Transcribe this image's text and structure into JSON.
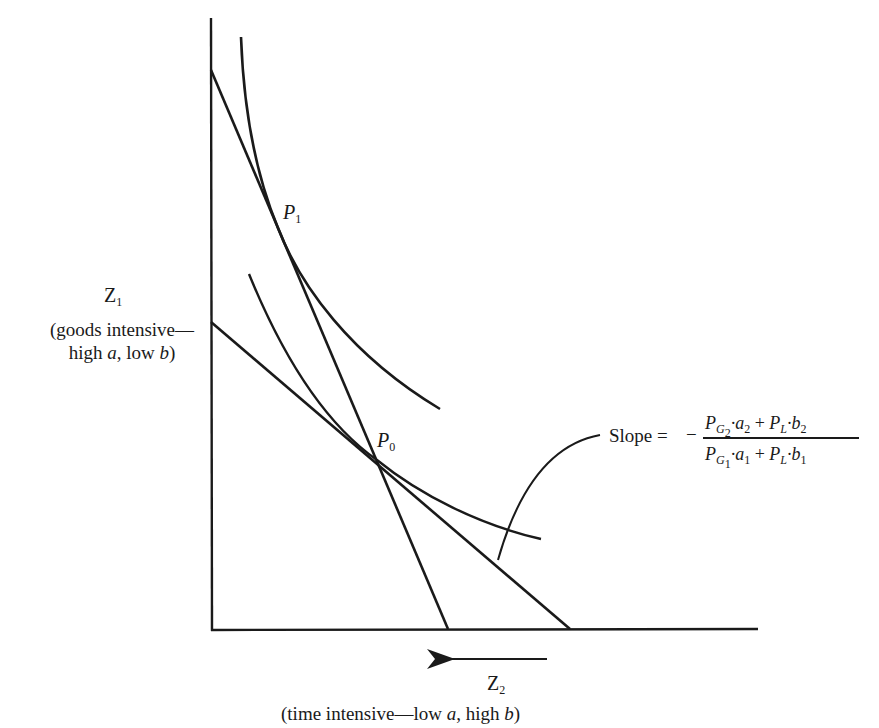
{
  "diagram": {
    "type": "indifference-curve budget-line diagram",
    "axes": {
      "y": {
        "label": "Z",
        "label_sub": "1",
        "description_line1": "(goods intensive—",
        "description_line2_a": "high ",
        "description_line2_b": "a",
        "description_line2_c": ", low ",
        "description_line2_d": "b",
        "description_line2_e": ")"
      },
      "x": {
        "label": "Z",
        "label_sub": "2",
        "description_a": "(time intensive—low ",
        "description_b": "a",
        "description_c": ", high ",
        "description_d": "b",
        "description_e": ")",
        "arrow_direction": "left"
      }
    },
    "points": [
      {
        "id": "P1",
        "label": "P",
        "sub": "1"
      },
      {
        "id": "P0",
        "label": "P",
        "sub": "0"
      }
    ],
    "annotation": {
      "prefix": "Slope =",
      "sign": "−",
      "numerator": {
        "t1": "P",
        "t1_sub": "G",
        "t1_subsub": "2",
        "t2": "·a",
        "t2_sub": "2",
        "plus": " + ",
        "t3": "P",
        "t3_sub": "L",
        "t4": "·b",
        "t4_sub": "2"
      },
      "denominator": {
        "t1": "P",
        "t1_sub": "G",
        "t1_subsub": "1",
        "t2": "·a",
        "t2_sub": "1",
        "plus": " + ",
        "t3": "P",
        "t3_sub": "L",
        "t4": "·b",
        "t4_sub": "1"
      }
    },
    "elements": [
      "steep budget line tangent at P1",
      "shallow budget line tangent at P0",
      "upper indifference curve through P1",
      "lower indifference curve through P0",
      "leader curve pointing to shallow line"
    ],
    "colors": {
      "ink": "#1a1a1a",
      "background": "#ffffff"
    }
  }
}
